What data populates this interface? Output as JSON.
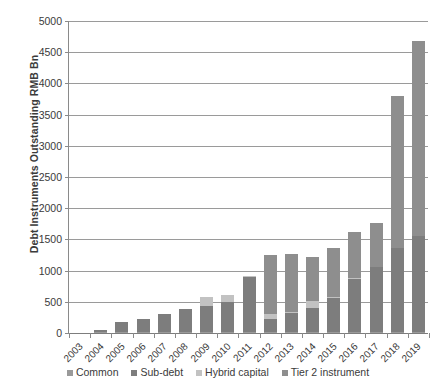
{
  "chart_data": {
    "type": "bar",
    "subtype": "stacked-bar",
    "title": "",
    "xlabel": "",
    "ylabel": "Debt Instruments Outstanding RMB Bn",
    "ylim": [
      0,
      5000
    ],
    "ytick_step": 500,
    "grid": true,
    "legend_position": "bottom",
    "categories": [
      "2003",
      "2004",
      "2005",
      "2006",
      "2007",
      "2008",
      "2009",
      "2010",
      "2011",
      "2012",
      "2013",
      "2014",
      "2015",
      "2016",
      "2017",
      "2018",
      "2019"
    ],
    "series": [
      {
        "name": "Common",
        "color": "#9a9a9a",
        "values": [
          0,
          5,
          10,
          10,
          10,
          10,
          10,
          10,
          10,
          10,
          10,
          10,
          10,
          10,
          10,
          10,
          10
        ]
      },
      {
        "name": "Sub-debt",
        "color": "#7d7d7d",
        "values": [
          0,
          35,
          160,
          215,
          290,
          365,
          425,
          480,
          890,
          215,
          300,
          395,
          545,
          850,
          1045,
          1355,
          1545
        ]
      },
      {
        "name": "Hybrid capital",
        "color": "#c2c2c2",
        "values": [
          0,
          0,
          0,
          0,
          0,
          0,
          145,
          110,
          10,
          75,
          25,
          110,
          20,
          10,
          0,
          0,
          0
        ]
      },
      {
        "name": "Tier 2 instrument",
        "color": "#8e8e8e",
        "values": [
          0,
          0,
          0,
          0,
          0,
          0,
          0,
          0,
          0,
          945,
          935,
          705,
          780,
          750,
          700,
          2425,
          3130
        ]
      }
    ],
    "totals": [
      0,
      40,
      170,
      225,
      300,
      375,
      580,
      600,
      910,
      1245,
      1270,
      1220,
      1355,
      1620,
      1755,
      3790,
      4685
    ],
    "ytick_labels": [
      "0",
      "500",
      "1000",
      "1500",
      "2000",
      "2500",
      "3000",
      "3500",
      "4000",
      "4500",
      "5000"
    ]
  },
  "axis": {
    "y_title": "Debt Instruments Outstanding RMB Bn"
  },
  "legend": {
    "items": [
      {
        "label": "Common",
        "color": "#9a9a9a"
      },
      {
        "label": "Sub-debt",
        "color": "#7d7d7d"
      },
      {
        "label": "Hybrid capital",
        "color": "#c2c2c2"
      },
      {
        "label": "Tier 2 instrument",
        "color": "#8e8e8e"
      }
    ]
  }
}
